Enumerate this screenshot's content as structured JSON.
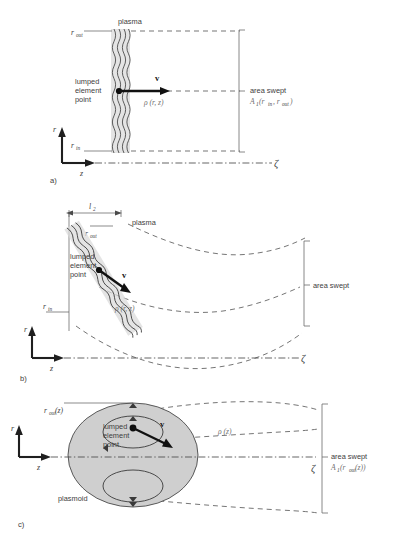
{
  "figure": {
    "background": "#ffffff",
    "ink": "#3d3d3d",
    "accent_gray": "#cfcfcf"
  },
  "panels": [
    {
      "id": "a",
      "label": "a)",
      "description": "Planar plasma sheet normal to the z axis sweeping an annular area",
      "labels": {
        "plasma": "plasma",
        "r_out": "r",
        "r_out_sub": "out",
        "r_in": "r",
        "r_in_sub": "in",
        "lumped_line1": "lumped",
        "lumped_line2": "element",
        "lumped_line3": "point",
        "velocity": "v",
        "rho": "ρ (r, z)",
        "area_swept": "area swept",
        "area_formula": "A",
        "area_formula_sub": "1",
        "area_formula_args": "(r",
        "area_formula_args_sub1": "in",
        "area_formula_args_mid": ", r",
        "area_formula_args_sub2": "out",
        "area_formula_args_end": ")",
        "axis_r": "r",
        "axis_z": "z",
        "axis_zeta": "ζ"
      }
    },
    {
      "id": "b",
      "label": "b)",
      "description": "Tilted plasma sheet with flaring dashed field lines sweeping a curved area",
      "labels": {
        "plasma": "plasma",
        "length": "l",
        "length_sub": "2",
        "r_out": "r",
        "r_out_sub": "out",
        "r_in": "r",
        "r_in_sub": "in",
        "lumped_line1": "lumped",
        "lumped_line2": "element",
        "lumped_line3": "point",
        "velocity": "v",
        "rho": "ρ (r, z)",
        "area_swept": "area swept",
        "axis_r": "r",
        "axis_z": "z",
        "axis_zeta": "ζ"
      }
    },
    {
      "id": "c",
      "label": "c)",
      "description": "Plasmoid ellipse with internal circulation loops sweeping an area",
      "labels": {
        "plasmoid": "plasmoid",
        "r_out": "r",
        "r_out_sub": "out",
        "r_out_arg": "(z)",
        "lumped_line1": "lumped",
        "lumped_line2": "element",
        "lumped_line3": "point",
        "velocity": "v",
        "rho": "ρ (z)",
        "area_swept": "area swept",
        "area_formula": "A",
        "area_formula_sub": "1",
        "area_formula_args": "(r",
        "area_formula_args_sub": "out",
        "area_formula_args_end": "(z))",
        "axis_r": "r",
        "axis_z": "z",
        "axis_zeta": "ζ"
      }
    }
  ]
}
